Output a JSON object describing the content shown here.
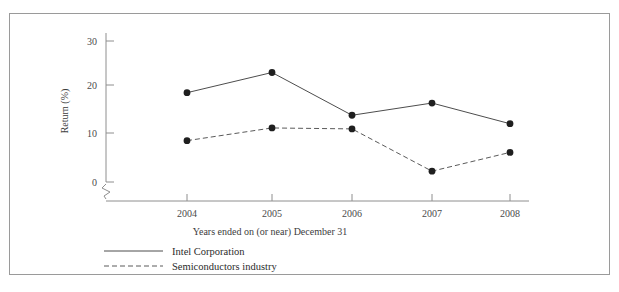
{
  "figure": {
    "top_caption_fragment": "",
    "border_color": "#9a9a9a",
    "background": "#ffffff"
  },
  "chart_data": {
    "type": "line",
    "title": "",
    "xlabel": "Years ended on (or near) December 31",
    "ylabel": "Return (%)",
    "categories": [
      "2004",
      "2005",
      "2006",
      "2007",
      "2008"
    ],
    "x_tick_labels": [
      "2004",
      "2005",
      "2006",
      "2007",
      "2008"
    ],
    "y_tick_labels": [
      "0",
      "10",
      "20",
      "30"
    ],
    "y_ticks": [
      0,
      10,
      20,
      30
    ],
    "ylim": [
      0,
      33
    ],
    "grid": false,
    "axis_break": true,
    "legend_position": "below-left",
    "series": [
      {
        "name": "Intel Corporation",
        "style": "solid",
        "color": "#4d4d4d",
        "marker": "filled-circle",
        "values": [
          19.0,
          23.3,
          14.2,
          16.8,
          12.4
        ]
      },
      {
        "name": "Semiconductors industry",
        "style": "dashed",
        "color": "#5a5a5a",
        "marker": "filled-circle",
        "values": [
          8.8,
          11.5,
          11.3,
          2.3,
          6.3
        ]
      }
    ]
  },
  "legend": {
    "items": [
      {
        "label": "Intel Corporation",
        "style": "solid"
      },
      {
        "label": "Semiconductors industry",
        "style": "dashed"
      }
    ]
  },
  "axes": {
    "y_label_0": "0",
    "y_label_10": "10",
    "y_label_20": "20",
    "y_label_30": "30",
    "x_label_2004": "2004",
    "x_label_2005": "2005",
    "x_label_2006": "2006",
    "x_label_2007": "2007",
    "x_label_2008": "2008",
    "y_axis_title": "Return (%)",
    "x_axis_title": "Years ended on (or near) December 31"
  }
}
